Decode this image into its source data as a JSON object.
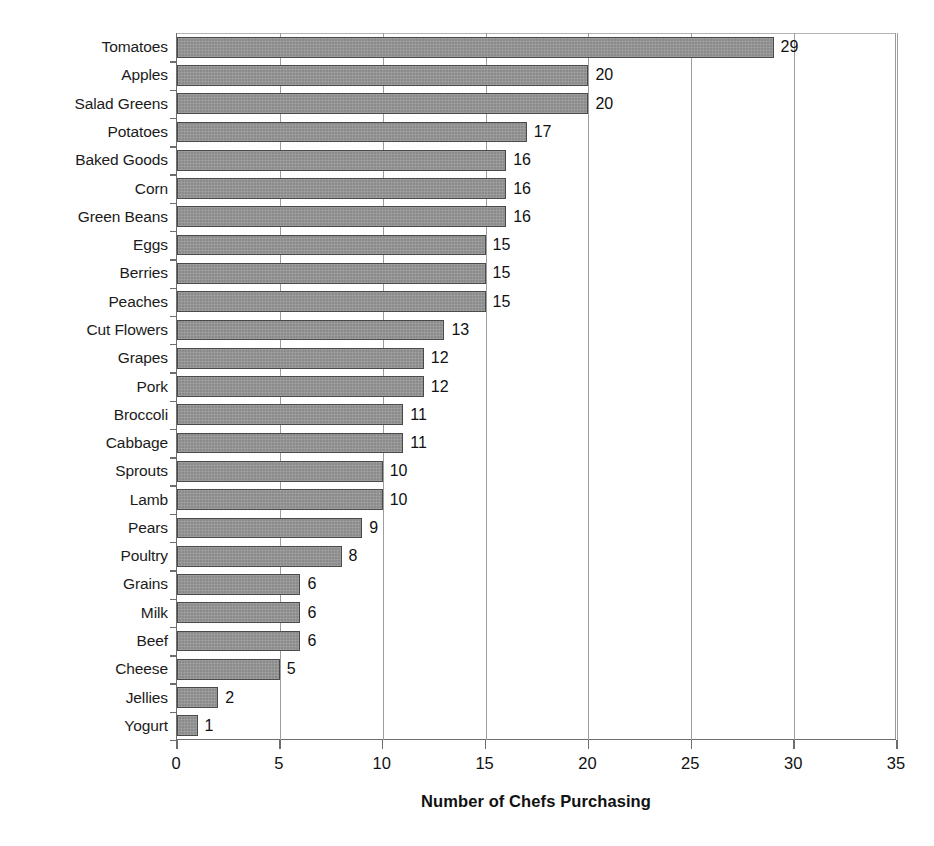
{
  "chart_data": {
    "type": "bar",
    "orientation": "horizontal",
    "title": "",
    "xlabel": "Number of Chefs Purchasing",
    "ylabel": "",
    "xlim": [
      0,
      35
    ],
    "xticks": [
      0,
      5,
      10,
      15,
      20,
      25,
      30,
      35
    ],
    "grid": "vertical",
    "legend": "none",
    "value_labels": true,
    "bar_color": "#8b8b8b",
    "bar_border_color": "#4a4a4a",
    "axis_color": "#6d6d6d",
    "gridline_color": "#9d9d9d",
    "text_color": "#111111",
    "categories": [
      "Tomatoes",
      "Apples",
      "Salad Greens",
      "Potatoes",
      "Baked Goods",
      "Corn",
      "Green Beans",
      "Eggs",
      "Berries",
      "Peaches",
      "Cut Flowers",
      "Grapes",
      "Pork",
      "Broccoli",
      "Cabbage",
      "Sprouts",
      "Lamb",
      "Pears",
      "Poultry",
      "Grains",
      "Milk",
      "Beef",
      "Cheese",
      "Jellies",
      "Yogurt"
    ],
    "values": [
      29,
      20,
      20,
      17,
      16,
      16,
      16,
      15,
      15,
      15,
      13,
      12,
      12,
      11,
      11,
      10,
      10,
      9,
      8,
      6,
      6,
      6,
      5,
      2,
      1
    ]
  }
}
